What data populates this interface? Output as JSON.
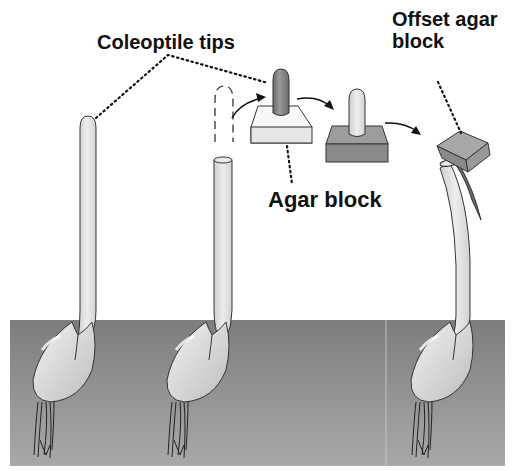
{
  "diagram": {
    "labels": {
      "coleoptile_tips": "Coleoptile tips",
      "agar_block": "Agar block",
      "offset_agar_block": "Offset agar\nblock"
    },
    "stages": [
      {
        "id": "intact-seedling",
        "description": "Intact coleoptile seedling"
      },
      {
        "id": "decapitated-seedling",
        "description": "Seedling with tip removed (dashed outline)"
      },
      {
        "id": "tip-on-agar",
        "description": "Excised tip placed on agar block"
      },
      {
        "id": "agar-with-tip",
        "description": "Agar block after tip exposure"
      },
      {
        "id": "bent-seedling",
        "description": "Decapitated seedling with offset agar block, bending"
      }
    ],
    "colors": {
      "soil": "#8c8c8c",
      "coleoptile": "#e2e2e2",
      "tip_dark": "#777777",
      "agar_light": "#e8e8e8",
      "agar_dark": "#8a8a8a",
      "outline": "#222222"
    }
  }
}
